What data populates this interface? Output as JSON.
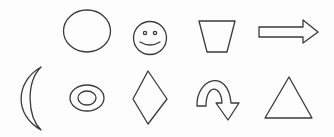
{
  "figure": {
    "background": "#ffffff",
    "stroke_color": "#3a3a3a",
    "rows": [
      {
        "row": "top",
        "shapes": [
          "ellipse",
          "smiley-face",
          "trapezoid",
          "right-arrow"
        ]
      },
      {
        "row": "bottom",
        "shapes": [
          "crescent",
          "concentric-ovals",
          "diamond",
          "u-turn-arrow",
          "triangle"
        ]
      }
    ]
  }
}
